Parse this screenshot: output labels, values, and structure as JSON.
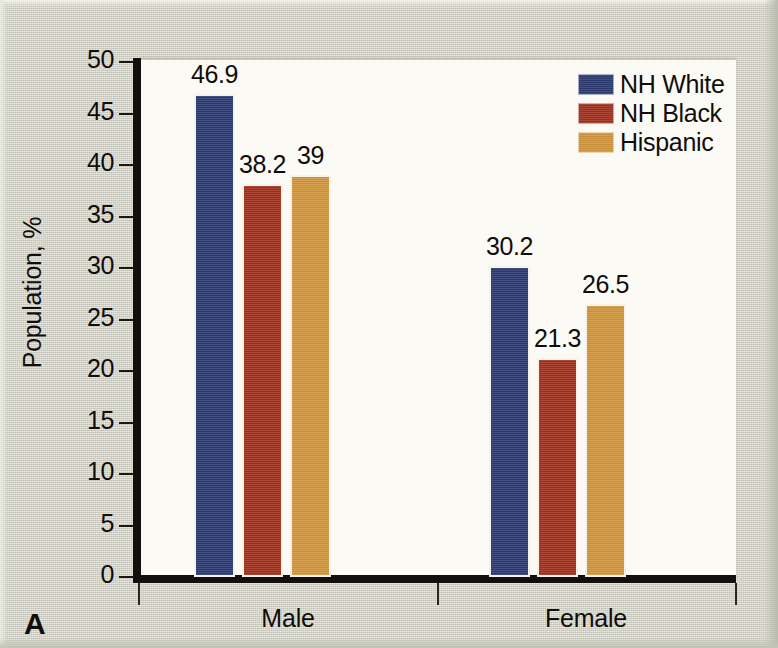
{
  "figure": {
    "panel_label": "A",
    "background_color": "#d2d3c7",
    "plot_background_color": "#fbfaf5",
    "axis_color": "#120f0c"
  },
  "chart_data": {
    "type": "bar",
    "title": "",
    "subtitle": "",
    "xlabel": "",
    "ylabel": "Population, %",
    "categories": [
      "Male",
      "Female"
    ],
    "series": [
      {
        "name": "NH White",
        "color": "#2e3c74",
        "values": [
          46.9,
          30.2
        ],
        "labels": [
          "46.9",
          "30.2"
        ]
      },
      {
        "name": "NH Black",
        "color": "#a33320",
        "values": [
          38.2,
          21.3
        ],
        "labels": [
          "38.2",
          "21.3"
        ]
      },
      {
        "name": "Hispanic",
        "color": "#d5983f",
        "values": [
          39,
          26.5
        ],
        "labels": [
          "39",
          "26.5"
        ]
      }
    ],
    "ylim": [
      0,
      50
    ],
    "ytick_step": 5,
    "ytick_labels": [
      "50",
      "45",
      "40",
      "35",
      "30",
      "25",
      "20",
      "15",
      "10",
      "5",
      "0"
    ],
    "grid": false,
    "legend_position": "top-right"
  }
}
